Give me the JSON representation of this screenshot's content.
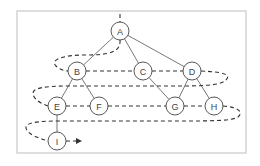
{
  "diagram": {
    "type": "tree-level-order-traversal",
    "frame": {
      "x": 17,
      "y": 11,
      "width": 229,
      "height": 142,
      "border_color": "#c8c8c8"
    },
    "nodes": [
      {
        "id": "A",
        "label": "A",
        "x": 120,
        "y": 31
      },
      {
        "id": "B",
        "label": "B",
        "x": 77,
        "y": 71
      },
      {
        "id": "C",
        "label": "C",
        "x": 143,
        "y": 71
      },
      {
        "id": "D",
        "label": "D",
        "x": 192,
        "y": 71
      },
      {
        "id": "E",
        "label": "E",
        "x": 57,
        "y": 106
      },
      {
        "id": "F",
        "label": "F",
        "x": 99,
        "y": 106
      },
      {
        "id": "G",
        "label": "G",
        "x": 175,
        "y": 106
      },
      {
        "id": "H",
        "label": "H",
        "x": 214,
        "y": 106
      },
      {
        "id": "I",
        "label": "I",
        "x": 57,
        "y": 141
      }
    ],
    "edges": [
      [
        "A",
        "B"
      ],
      [
        "A",
        "C"
      ],
      [
        "A",
        "D"
      ],
      [
        "B",
        "E"
      ],
      [
        "B",
        "F"
      ],
      [
        "C",
        "G"
      ],
      [
        "D",
        "G"
      ],
      [
        "D",
        "H"
      ],
      [
        "E",
        "I"
      ]
    ],
    "traversal_order": [
      "A",
      "B",
      "C",
      "D",
      "E",
      "F",
      "G",
      "H",
      "I"
    ],
    "colors": {
      "node_stroke": "#444444",
      "edge": "#555555",
      "traversal_path": "#333333"
    }
  }
}
